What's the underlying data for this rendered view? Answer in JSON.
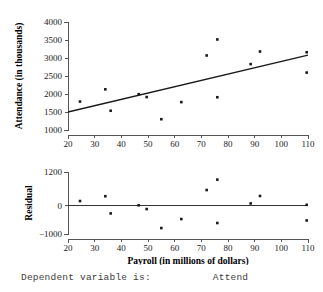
{
  "footer": {
    "label": "Dependent variable is:",
    "value": "Attend"
  },
  "chart_data": [
    {
      "type": "scatter",
      "name": "attendance-vs-payroll",
      "title": "",
      "xlabel": "Payroll (in millions of dollars)",
      "ylabel": "Attendance (in thousands)",
      "xlim": [
        20,
        110
      ],
      "ylim": [
        1000,
        4000
      ],
      "xticks": [
        20,
        30,
        40,
        50,
        60,
        70,
        80,
        90,
        100,
        110
      ],
      "yticks": [
        1000,
        1500,
        2000,
        2500,
        3000,
        3000,
        3500,
        4000
      ],
      "ytick_labels": [
        "1000",
        "1500",
        "2000",
        "2500",
        "3000",
        "3500",
        "4000"
      ],
      "xtick_labels": [
        "20",
        "30",
        "40",
        "50",
        "60",
        "70",
        "80",
        "90",
        "100",
        "110"
      ],
      "grid": false,
      "legend": false,
      "points": [
        {
          "x": 24.5,
          "y": 1790
        },
        {
          "x": 34.0,
          "y": 2130
        },
        {
          "x": 36.0,
          "y": 1535
        },
        {
          "x": 46.5,
          "y": 1995
        },
        {
          "x": 49.5,
          "y": 1915
        },
        {
          "x": 55.0,
          "y": 1300
        },
        {
          "x": 62.5,
          "y": 1775
        },
        {
          "x": 72.0,
          "y": 3070
        },
        {
          "x": 76.0,
          "y": 3515
        },
        {
          "x": 76.0,
          "y": 1910
        },
        {
          "x": 88.5,
          "y": 2830
        },
        {
          "x": 92.0,
          "y": 3180
        },
        {
          "x": 109.5,
          "y": 3160
        },
        {
          "x": 109.5,
          "y": 2595
        }
      ],
      "fit_line": {
        "x1": 20,
        "y1": 1500,
        "x2": 110,
        "y2": 3080
      }
    },
    {
      "type": "scatter",
      "name": "residuals-vs-payroll",
      "title": "",
      "xlabel": "Payroll (in millions of dollars)",
      "ylabel": "Residual",
      "xlim": [
        20,
        110
      ],
      "ylim": [
        -1000,
        1200
      ],
      "xticks": [
        20,
        30,
        40,
        50,
        60,
        70,
        80,
        90,
        100,
        110
      ],
      "yticks": [
        -1000,
        0,
        1200
      ],
      "ytick_labels": [
        "−1000",
        "0",
        "1200"
      ],
      "xtick_labels": [
        "20",
        "30",
        "40",
        "50",
        "60",
        "70",
        "80",
        "90",
        "100",
        "110"
      ],
      "grid": false,
      "legend": false,
      "zero_reference_line": 0,
      "points": [
        {
          "x": 24.5,
          "y": 170
        },
        {
          "x": 34.0,
          "y": 340
        },
        {
          "x": 36.0,
          "y": -270
        },
        {
          "x": 46.5,
          "y": 20
        },
        {
          "x": 49.5,
          "y": -115
        },
        {
          "x": 55.0,
          "y": -790
        },
        {
          "x": 62.5,
          "y": -470
        },
        {
          "x": 72.0,
          "y": 560
        },
        {
          "x": 76.0,
          "y": 930
        },
        {
          "x": 76.0,
          "y": -610
        },
        {
          "x": 88.5,
          "y": 85
        },
        {
          "x": 92.0,
          "y": 350
        },
        {
          "x": 109.5,
          "y": 35
        },
        {
          "x": 109.5,
          "y": -520
        }
      ]
    }
  ]
}
